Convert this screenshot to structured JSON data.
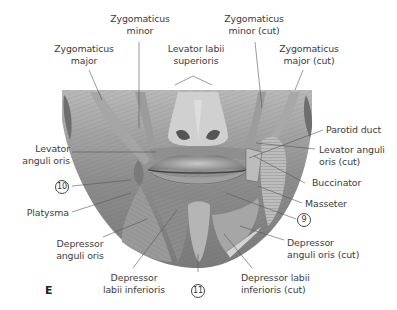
{
  "figure": {
    "panel_letter": "E",
    "colors": {
      "background": "#ffffff",
      "illustration_tone": "#8a8a8a",
      "label_text": "#3c3c3c",
      "leader_line": "#555555"
    }
  },
  "labels": {
    "zygomaticus_minor": [
      "Zygomaticus",
      "minor"
    ],
    "zygomaticus_major": [
      "Zygomaticus",
      "major"
    ],
    "levator_labii_superioris": [
      "Levator labii",
      "superioris"
    ],
    "zygomaticus_minor_cut": [
      "Zygomaticus",
      "minor (cut)"
    ],
    "zygomaticus_major_cut": [
      "Zygomaticus",
      "major (cut)"
    ],
    "parotid_duct": "Parotid duct",
    "levator_anguli_oris_cut": [
      "Levator anguli",
      "oris (cut)"
    ],
    "buccinator": "Buccinator",
    "masseter": "Masseter",
    "num_9": "9",
    "depressor_anguli_oris_cut": [
      "Depressor",
      "anguli oris (cut)"
    ],
    "depressor_labii_inferioris_cut": [
      "Depressor labii",
      "inferioris (cut)"
    ],
    "num_11": "11",
    "depressor_labii_inferioris": [
      "Depressor",
      "labii inferioris"
    ],
    "depressor_anguli_oris": [
      "Depressor",
      "anguli oris"
    ],
    "platysma": "Platysma",
    "num_10": "10",
    "levator_anguli_oris": [
      "Levator",
      "anguli oris"
    ]
  }
}
